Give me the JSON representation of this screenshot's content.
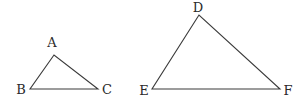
{
  "figure": {
    "triangles": [
      {
        "name": "ABC",
        "vertices": [
          {
            "label": "A",
            "x": 54,
            "y": 55,
            "lx": 52,
            "ly": 47
          },
          {
            "label": "B",
            "x": 30,
            "y": 89,
            "lx": 21,
            "ly": 94
          },
          {
            "label": "C",
            "x": 98,
            "y": 89,
            "lx": 107,
            "ly": 94
          }
        ]
      },
      {
        "name": "DEF",
        "vertices": [
          {
            "label": "D",
            "x": 199,
            "y": 15,
            "lx": 198,
            "ly": 12
          },
          {
            "label": "E",
            "x": 152,
            "y": 89,
            "lx": 144,
            "ly": 95
          },
          {
            "label": "F",
            "x": 280,
            "y": 89,
            "lx": 288,
            "ly": 95
          }
        ]
      }
    ],
    "colors": {
      "stroke": "#3a3a3a",
      "text": "#2a2a2a",
      "background": "#ffffff"
    }
  }
}
